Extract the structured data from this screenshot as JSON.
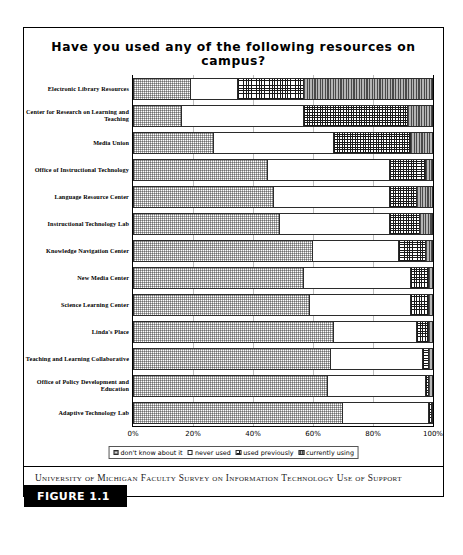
{
  "figure": {
    "tag": "FIGURE 1.1",
    "caption": "University of Michigan Faculty Survey on Information Technology Use of Support Resources"
  },
  "chart_data": {
    "type": "bar",
    "orientation": "horizontal",
    "stacked": true,
    "normalized_percent": true,
    "title": "Have you used any of the following resources on campus?",
    "xlabel": "",
    "ylabel": "",
    "xlim": [
      0,
      100
    ],
    "xticks": [
      "0%",
      "20%",
      "40%",
      "60%",
      "80%",
      "100%"
    ],
    "xtick_values": [
      0,
      20,
      40,
      60,
      80,
      100
    ],
    "grid": true,
    "legend_position": "bottom",
    "categories": [
      "Electronic Library Resources",
      "Center for Research on Learning and Teaching",
      "Media Union",
      "Office of Instructional Technology",
      "Language Resource Center",
      "Instructional Technology Lab",
      "Knowledge  Navigation Center",
      "New Media Center",
      "Science Learning Center",
      "Linda's Place",
      "Teaching and Learning Collaborative",
      "Office of Policy Development and Education",
      "Adaptive Technology Lab"
    ],
    "series": [
      {
        "name": "don't know about it",
        "pattern": "stipple-gray",
        "values": [
          19,
          16,
          27,
          45,
          47,
          49,
          60,
          57,
          59,
          67,
          66,
          65,
          70
        ]
      },
      {
        "name": "never used",
        "pattern": "white",
        "values": [
          16,
          41,
          40,
          41,
          39,
          37,
          29,
          36,
          34,
          28,
          31,
          33,
          29
        ]
      },
      {
        "name": "used previously",
        "pattern": "crosshatch",
        "values": [
          22,
          35,
          26,
          12,
          9,
          10,
          9,
          6,
          6,
          4,
          2,
          1,
          1
        ]
      },
      {
        "name": "currently using",
        "pattern": "vertical-stripe",
        "values": [
          43,
          8,
          7,
          2,
          5,
          4,
          2,
          1,
          1,
          1,
          1,
          1,
          0
        ]
      }
    ]
  }
}
